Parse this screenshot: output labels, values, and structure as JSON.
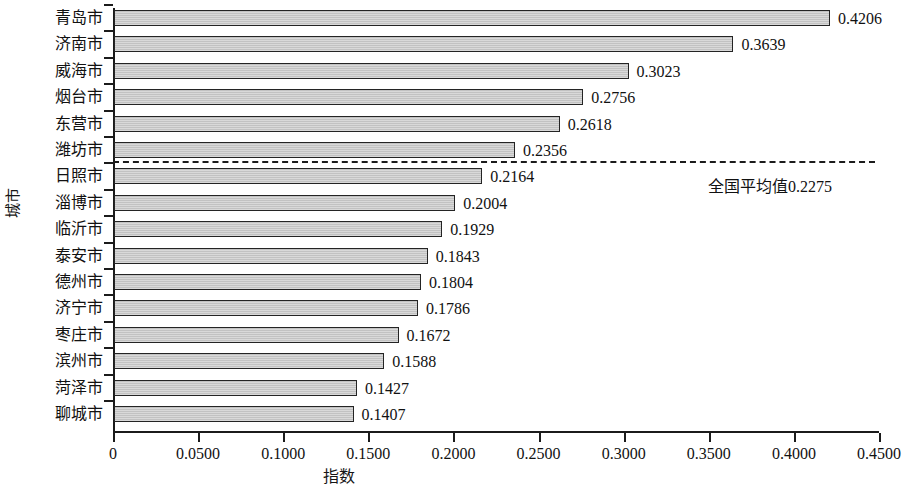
{
  "chart_data": {
    "type": "bar",
    "orientation": "horizontal",
    "title": "",
    "xlabel": "指数",
    "ylabel": "城市",
    "xlim": [
      0,
      0.45
    ],
    "xticks": [
      0,
      0.05,
      0.1,
      0.15,
      0.2,
      0.25,
      0.3,
      0.35,
      0.4,
      0.45
    ],
    "xtick_labels": [
      "0",
      "0.0500",
      "0.1000",
      "0.1500",
      "0.2000",
      "0.2500",
      "0.3000",
      "0.3500",
      "0.4000",
      "0.4500"
    ],
    "grid": false,
    "legend": false,
    "categories": [
      "青岛市",
      "济南市",
      "威海市",
      "烟台市",
      "东营市",
      "潍坊市",
      "日照市",
      "淄博市",
      "临沂市",
      "泰安市",
      "德州市",
      "济宁市",
      "枣庄市",
      "滨州市",
      "菏泽市",
      "聊城市"
    ],
    "values": [
      0.4206,
      0.3639,
      0.3023,
      0.2756,
      0.2618,
      0.2356,
      0.2164,
      0.2004,
      0.1929,
      0.1843,
      0.1804,
      0.1786,
      0.1672,
      0.1588,
      0.1427,
      0.1407
    ],
    "value_labels": [
      "0.4206",
      "0.3639",
      "0.3023",
      "0.2756",
      "0.2618",
      "0.2356",
      "0.2164",
      "0.2004",
      "0.1929",
      "0.1843",
      "0.1804",
      "0.1786",
      "0.1672",
      "0.1588",
      "0.1427",
      "0.1407"
    ],
    "annotations": [
      {
        "kind": "reference-line",
        "label": "全国平均值0.2275",
        "value": 0.2275,
        "style": "dashed-horizontal"
      }
    ],
    "colors": {
      "bar_fill": "#c9c9c9",
      "bar_edge": "#242424",
      "axis": "#1b1b1b",
      "text": "#111111"
    }
  }
}
